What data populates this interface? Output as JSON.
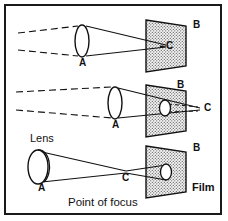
{
  "figure": {
    "caption": "Point of focus",
    "film_label": "Film",
    "lens_label": "Lens",
    "border_color": "#1a1a1a",
    "line_color": "#111111",
    "film_fill": "#f2f2f2",
    "film_stipple": "#4a4a4a"
  },
  "panels": [
    {
      "id": "panel-top",
      "description": "Focus point behind the film plane",
      "labels": {
        "lens": "A",
        "film_plane": "B",
        "focus_point": "C"
      }
    },
    {
      "id": "panel-middle",
      "description": "Focus point beyond the film plane, blur circle on film",
      "labels": {
        "lens": "A",
        "film_plane": "B",
        "focus_point": "C"
      }
    },
    {
      "id": "panel-bottom",
      "description": "Focus point in front of the film plane",
      "labels": {
        "lens": "A",
        "film_plane": "B",
        "focus_point": "C",
        "lens_name": "Lens",
        "film_name": "Film"
      }
    }
  ]
}
